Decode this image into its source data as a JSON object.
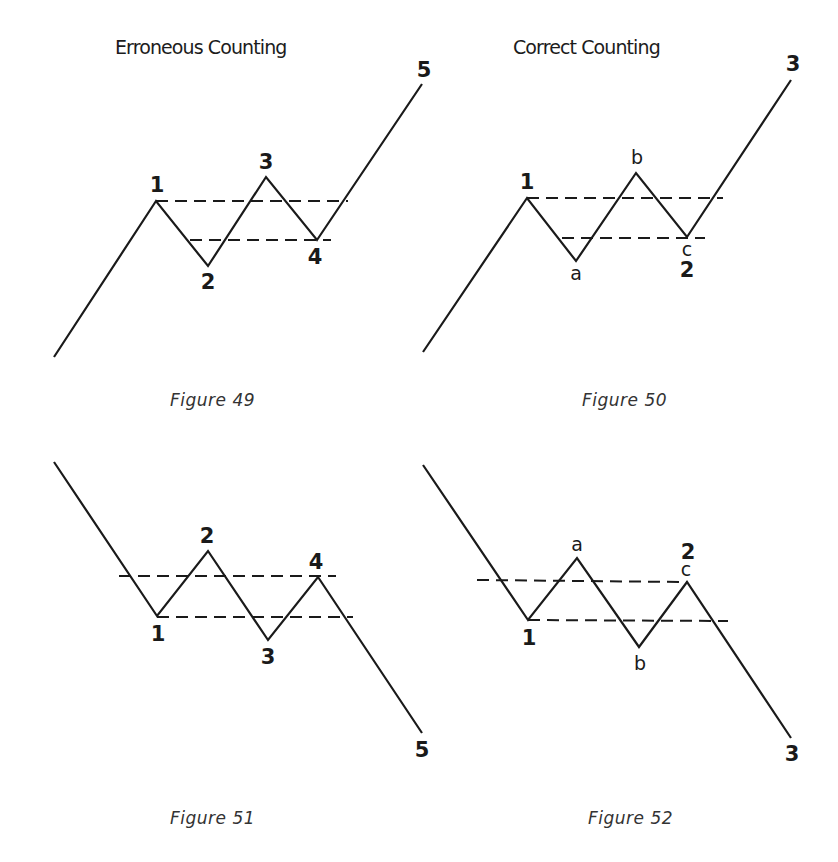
{
  "headings": {
    "left": "Erroneous Counting",
    "right": "Correct Counting"
  },
  "figures": [
    {
      "id": "fig49",
      "caption": "Figure 49",
      "wave_points": [
        [
          54,
          357
        ],
        [
          156,
          201
        ],
        [
          208,
          266
        ],
        [
          266,
          177
        ],
        [
          317,
          240
        ],
        [
          422,
          84
        ]
      ],
      "dashed_lines": [
        [
          [
            156,
            201
          ],
          [
            348,
            201
          ]
        ],
        [
          [
            190,
            240
          ],
          [
            331,
            240
          ]
        ]
      ],
      "labels": [
        {
          "text": "1",
          "x": 157,
          "y": 175
        },
        {
          "text": "2",
          "x": 208,
          "y": 272
        },
        {
          "text": "3",
          "x": 266,
          "y": 152
        },
        {
          "text": "4",
          "x": 315,
          "y": 247
        },
        {
          "text": "5",
          "x": 424,
          "y": 60
        }
      ]
    },
    {
      "id": "fig50",
      "caption": "Figure 50",
      "wave_points": [
        [
          423,
          352
        ],
        [
          527,
          198
        ],
        [
          576,
          261
        ],
        [
          636,
          173
        ],
        [
          687,
          237
        ],
        [
          791,
          80
        ]
      ],
      "dashed_lines": [
        [
          [
            527,
            198
          ],
          [
            723,
            198
          ]
        ],
        [
          [
            562,
            238
          ],
          [
            705,
            238
          ]
        ]
      ],
      "labels": [
        {
          "text": "1",
          "x": 527,
          "y": 172
        },
        {
          "text": "a",
          "x": 576,
          "y": 264,
          "small": true
        },
        {
          "text": "b",
          "x": 637,
          "y": 148,
          "small": true
        },
        {
          "text": "c",
          "x": 687,
          "y": 240,
          "small": true
        },
        {
          "text": "2",
          "x": 687,
          "y": 260
        },
        {
          "text": "3",
          "x": 793,
          "y": 54
        }
      ]
    },
    {
      "id": "fig51",
      "caption": "Figure 51",
      "wave_points": [
        [
          54,
          462
        ],
        [
          157,
          616
        ],
        [
          208,
          551
        ],
        [
          268,
          640
        ],
        [
          318,
          577
        ],
        [
          422,
          733
        ]
      ],
      "dashed_lines": [
        [
          [
            119,
            576
          ],
          [
            336,
            576
          ]
        ],
        [
          [
            157,
            617
          ],
          [
            353,
            617
          ]
        ]
      ],
      "labels": [
        {
          "text": "1",
          "x": 158,
          "y": 624
        },
        {
          "text": "2",
          "x": 207,
          "y": 526
        },
        {
          "text": "3",
          "x": 268,
          "y": 647
        },
        {
          "text": "4",
          "x": 316,
          "y": 552
        },
        {
          "text": "5",
          "x": 422,
          "y": 740
        }
      ]
    },
    {
      "id": "fig52",
      "caption": "Figure 52",
      "wave_points": [
        [
          423,
          465
        ],
        [
          528,
          620
        ],
        [
          577,
          558
        ],
        [
          639,
          647
        ],
        [
          687,
          582
        ],
        [
          791,
          738
        ]
      ],
      "dashed_lines": [
        [
          [
            477,
            580
          ],
          [
            687,
            582
          ]
        ],
        [
          [
            528,
            620
          ],
          [
            728,
            621
          ]
        ]
      ],
      "labels": [
        {
          "text": "1",
          "x": 529,
          "y": 628
        },
        {
          "text": "a",
          "x": 577,
          "y": 535,
          "small": true
        },
        {
          "text": "b",
          "x": 640,
          "y": 654,
          "small": true
        },
        {
          "text": "c",
          "x": 686,
          "y": 560,
          "small": true
        },
        {
          "text": "2",
          "x": 688,
          "y": 542
        },
        {
          "text": "3",
          "x": 792,
          "y": 744
        }
      ]
    }
  ],
  "caption_positions": {
    "fig49": {
      "x": 170,
      "y": 390
    },
    "fig50": {
      "x": 582,
      "y": 390
    },
    "fig51": {
      "x": 170,
      "y": 808
    },
    "fig52": {
      "x": 588,
      "y": 808
    }
  }
}
